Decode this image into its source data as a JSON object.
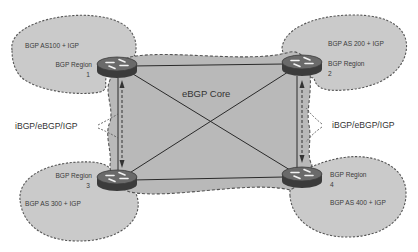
{
  "diagram": {
    "type": "network-topology",
    "core": {
      "label": "eBGP Core",
      "fill": "#b9b9b9"
    },
    "region_fill": "#c9c9c9",
    "regions": [
      {
        "id": 1,
        "as_label": "BGP AS100 + IGP",
        "region_label": "BGP Region",
        "region_number": "1"
      },
      {
        "id": 2,
        "as_label": "BGP AS 200 + IGP",
        "region_label": "BGP Region",
        "region_number": "2"
      },
      {
        "id": 3,
        "as_label": "BGP AS 300 + IGP",
        "region_label": "BGP Region",
        "region_number": "3"
      },
      {
        "id": 4,
        "as_label": "BGP AS 400 + IGP",
        "region_label": "BGP Region",
        "region_number": "4"
      }
    ],
    "connections": [
      {
        "from": 1,
        "to": 2,
        "style": "solid"
      },
      {
        "from": 3,
        "to": 4,
        "style": "solid"
      },
      {
        "from": 1,
        "to": 3,
        "style": "solid"
      },
      {
        "from": 2,
        "to": 4,
        "style": "solid"
      },
      {
        "from": 1,
        "to": 4,
        "style": "solid"
      },
      {
        "from": 2,
        "to": 3,
        "style": "solid"
      }
    ],
    "link_annotations": {
      "left": "iBGP/eBGP/IGP",
      "right": "iBGP/eBGP/IGP"
    }
  }
}
